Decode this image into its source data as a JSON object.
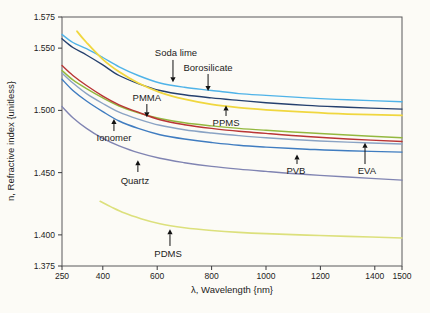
{
  "figure": {
    "background": "#fcfbf6",
    "frame_color": "#58585a",
    "tick_color": "#3a3a3c",
    "text_color": "#1c1c1c",
    "annotation_arrow_color": "#111111"
  },
  "chart_data": {
    "type": "line",
    "title": "",
    "xlabel": "λ, Wavelength {nm}",
    "ylabel": "n, Refractive index {unitless}",
    "xlim": [
      250,
      1500
    ],
    "ylim": [
      1.375,
      1.575
    ],
    "grid": false,
    "legend_position": "inline-annotations",
    "x_ticks": [
      250,
      400,
      600,
      800,
      1000,
      1200,
      1400,
      1500
    ],
    "x_tick_labels": [
      "250",
      "400",
      "600",
      "800",
      "1000",
      "1200",
      "1400",
      "1500"
    ],
    "y_ticks": [
      1.375,
      1.4,
      1.45,
      1.5,
      1.55,
      1.575
    ],
    "y_tick_labels": [
      "1.375",
      "1.400",
      "1.450",
      "1.500",
      "1.550",
      "1.575"
    ],
    "series": [
      {
        "name": "Soda lime",
        "color": "#4fb3e8",
        "width": 1.4,
        "points": [
          [
            250,
            1.561
          ],
          [
            290,
            1.5545
          ],
          [
            340,
            1.5495
          ],
          [
            400,
            1.5425
          ],
          [
            460,
            1.535
          ],
          [
            530,
            1.528
          ],
          [
            610,
            1.522
          ],
          [
            700,
            1.5185
          ],
          [
            800,
            1.516
          ],
          [
            900,
            1.5135
          ],
          [
            1000,
            1.512
          ],
          [
            1150,
            1.51
          ],
          [
            1300,
            1.5085
          ],
          [
            1500,
            1.507
          ]
        ]
      },
      {
        "name": "Borosilicate",
        "color": "#25406e",
        "width": 1.4,
        "points": [
          [
            250,
            1.5575
          ],
          [
            290,
            1.5505
          ],
          [
            340,
            1.5445
          ],
          [
            400,
            1.5365
          ],
          [
            460,
            1.528
          ],
          [
            530,
            1.5215
          ],
          [
            610,
            1.516
          ],
          [
            700,
            1.5125
          ],
          [
            800,
            1.51
          ],
          [
            900,
            1.508
          ],
          [
            1000,
            1.5062
          ],
          [
            1150,
            1.504
          ],
          [
            1300,
            1.5025
          ],
          [
            1500,
            1.501
          ]
        ]
      },
      {
        "name": "PPMS",
        "color": "#f0d73f",
        "width": 1.8,
        "points": [
          [
            305,
            1.5635
          ],
          [
            340,
            1.5545
          ],
          [
            400,
            1.541
          ],
          [
            460,
            1.531
          ],
          [
            530,
            1.522
          ],
          [
            610,
            1.5145
          ],
          [
            700,
            1.509
          ],
          [
            800,
            1.5048
          ],
          [
            900,
            1.5022
          ],
          [
            1000,
            1.5005
          ],
          [
            1150,
            1.4985
          ],
          [
            1300,
            1.497
          ],
          [
            1500,
            1.496
          ]
        ]
      },
      {
        "name": "PMMA",
        "color": "#93b83f",
        "width": 1.4,
        "points": [
          [
            250,
            1.532
          ],
          [
            290,
            1.5245
          ],
          [
            340,
            1.5175
          ],
          [
            400,
            1.51
          ],
          [
            460,
            1.5035
          ],
          [
            530,
            1.498
          ],
          [
            610,
            1.4935
          ],
          [
            700,
            1.49
          ],
          [
            800,
            1.4875
          ],
          [
            900,
            1.4855
          ],
          [
            1000,
            1.484
          ],
          [
            1150,
            1.482
          ],
          [
            1300,
            1.4802
          ],
          [
            1500,
            1.478
          ]
        ]
      },
      {
        "name": "EVA",
        "color": "#b93535",
        "width": 1.4,
        "points": [
          [
            250,
            1.536
          ],
          [
            290,
            1.528
          ],
          [
            340,
            1.52
          ],
          [
            400,
            1.5115
          ],
          [
            460,
            1.5045
          ],
          [
            530,
            1.4985
          ],
          [
            610,
            1.4925
          ],
          [
            700,
            1.4885
          ],
          [
            800,
            1.4855
          ],
          [
            900,
            1.4832
          ],
          [
            1000,
            1.4815
          ],
          [
            1150,
            1.479
          ],
          [
            1300,
            1.477
          ],
          [
            1500,
            1.475
          ]
        ]
      },
      {
        "name": "Ionomer",
        "color": "#8aa3c4",
        "width": 1.4,
        "points": [
          [
            250,
            1.53
          ],
          [
            290,
            1.522
          ],
          [
            340,
            1.5135
          ],
          [
            400,
            1.5055
          ],
          [
            460,
            1.4985
          ],
          [
            530,
            1.493
          ],
          [
            610,
            1.488
          ],
          [
            700,
            1.4845
          ],
          [
            800,
            1.4818
          ],
          [
            900,
            1.4797
          ],
          [
            1000,
            1.478
          ],
          [
            1150,
            1.476
          ],
          [
            1300,
            1.4745
          ],
          [
            1500,
            1.473
          ]
        ]
      },
      {
        "name": "PVB",
        "color": "#3f7cc0",
        "width": 1.4,
        "points": [
          [
            250,
            1.525
          ],
          [
            290,
            1.516
          ],
          [
            340,
            1.5075
          ],
          [
            400,
            1.499
          ],
          [
            460,
            1.4915
          ],
          [
            530,
            1.4855
          ],
          [
            610,
            1.4805
          ],
          [
            700,
            1.477
          ],
          [
            800,
            1.4742
          ],
          [
            900,
            1.472
          ],
          [
            1000,
            1.4705
          ],
          [
            1150,
            1.4688
          ],
          [
            1300,
            1.4675
          ],
          [
            1500,
            1.4665
          ]
        ]
      },
      {
        "name": "Quartz",
        "color": "#8084b2",
        "width": 1.4,
        "points": [
          [
            250,
            1.503
          ],
          [
            290,
            1.494
          ],
          [
            340,
            1.4855
          ],
          [
            400,
            1.4775
          ],
          [
            460,
            1.4715
          ],
          [
            530,
            1.466
          ],
          [
            610,
            1.4615
          ],
          [
            700,
            1.458
          ],
          [
            800,
            1.455
          ],
          [
            900,
            1.4528
          ],
          [
            1000,
            1.451
          ],
          [
            1150,
            1.4485
          ],
          [
            1300,
            1.4465
          ],
          [
            1500,
            1.444
          ]
        ]
      },
      {
        "name": "PDMS",
        "color": "#dce07c",
        "width": 1.6,
        "points": [
          [
            390,
            1.427
          ],
          [
            430,
            1.4225
          ],
          [
            480,
            1.4175
          ],
          [
            540,
            1.413
          ],
          [
            610,
            1.409
          ],
          [
            700,
            1.4058
          ],
          [
            800,
            1.4035
          ],
          [
            900,
            1.402
          ],
          [
            1000,
            1.401
          ],
          [
            1150,
            1.3998
          ],
          [
            1300,
            1.3988
          ],
          [
            1500,
            1.3975
          ]
        ]
      }
    ],
    "annotations": [
      {
        "label": "Soda lime",
        "text_x": 669,
        "text_y": 1.546,
        "arrow_x": 658,
        "from_y": 1.5405,
        "to_y": 1.5225,
        "dir": "down"
      },
      {
        "label": "Borosilicate",
        "text_x": 787,
        "text_y": 1.534,
        "arrow_x": 787,
        "from_y": 1.5292,
        "to_y": 1.5155,
        "dir": "down"
      },
      {
        "label": "PMMA",
        "text_x": 562,
        "text_y": 1.51,
        "arrow_x": 562,
        "from_y": 1.5051,
        "to_y": 1.4945,
        "dir": "down"
      },
      {
        "label": "PPMS",
        "text_x": 853,
        "text_y": 1.4895,
        "arrow_x": 853,
        "from_y": 1.4955,
        "to_y": 1.504,
        "dir": "up"
      },
      {
        "label": "Ionomer",
        "text_x": 441,
        "text_y": 1.4775,
        "arrow_x": 441,
        "from_y": 1.4834,
        "to_y": 1.493,
        "dir": "up"
      },
      {
        "label": "Quartz",
        "text_x": 518,
        "text_y": 1.443,
        "arrow_x": 529,
        "from_y": 1.4505,
        "to_y": 1.46,
        "dir": "up"
      },
      {
        "label": "PVB",
        "text_x": 1110,
        "text_y": 1.451,
        "arrow_x": 1114,
        "from_y": 1.4569,
        "to_y": 1.4645,
        "dir": "up"
      },
      {
        "label": "EVA",
        "text_x": 1371,
        "text_y": 1.451,
        "arrow_x": 1364,
        "from_y": 1.4569,
        "to_y": 1.474,
        "dir": "up"
      },
      {
        "label": "PDMS",
        "text_x": 640,
        "text_y": 1.385,
        "arrow_x": 647,
        "from_y": 1.3911,
        "to_y": 1.4045,
        "dir": "up"
      }
    ]
  }
}
